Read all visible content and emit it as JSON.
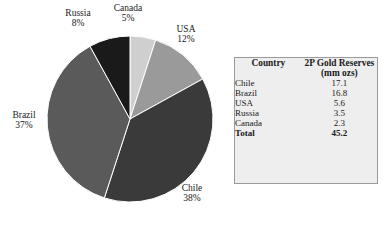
{
  "chart_data": {
    "type": "pie",
    "title": "",
    "xlabel": "",
    "ylabel": "",
    "legend_position": "labels-outside",
    "grid": false,
    "units": "mm ozs",
    "categories": [
      "Canada",
      "USA",
      "Chile",
      "Brazil",
      "Russia"
    ],
    "values": [
      5,
      12,
      38,
      37,
      8
    ],
    "value_unit": "percent",
    "start_angle_deg": 0,
    "direction": "clockwise",
    "slices": [
      {
        "label": "Canada",
        "percent_text": "5%",
        "percent": 5,
        "color": "#cfcfcf",
        "reserves": 2.3
      },
      {
        "label": "USA",
        "percent_text": "12%",
        "percent": 12,
        "color": "#9a9a9a",
        "reserves": 5.6
      },
      {
        "label": "Chile",
        "percent_text": "38%",
        "percent": 38,
        "color": "#3a3a3a",
        "reserves": 17.1
      },
      {
        "label": "Brazil",
        "percent_text": "37%",
        "percent": 37,
        "color": "#5a5a5a",
        "reserves": 16.8
      },
      {
        "label": "Russia",
        "percent_text": "8%",
        "percent": 8,
        "color": "#1a1a1a",
        "reserves": 3.5
      }
    ]
  },
  "pie": {
    "labels": {
      "russia": {
        "name": "Russia",
        "percent": "8%"
      },
      "canada": {
        "name": "Canada",
        "percent": "5%"
      },
      "usa": {
        "name": "USA",
        "percent": "12%"
      },
      "brazil": {
        "name": "Brazil",
        "percent": "37%"
      },
      "chile": {
        "name": "Chile",
        "percent": "38%"
      }
    }
  },
  "table": {
    "header": {
      "country": "Country",
      "reserves": "2P Gold Reserves",
      "units": "(mm ozs)"
    },
    "rows": [
      {
        "country": "Chile",
        "value": "17.1"
      },
      {
        "country": "Brazil",
        "value": "16.8"
      },
      {
        "country": "USA",
        "value": "5.6"
      },
      {
        "country": "Russia",
        "value": "3.5"
      },
      {
        "country": "Canada",
        "value": "2.3"
      }
    ],
    "total": {
      "country": "Total",
      "value": "45.2"
    },
    "colors": {
      "background": "#eeeeee",
      "border": "#9a9a9a",
      "text": "#1a1a1a"
    }
  }
}
